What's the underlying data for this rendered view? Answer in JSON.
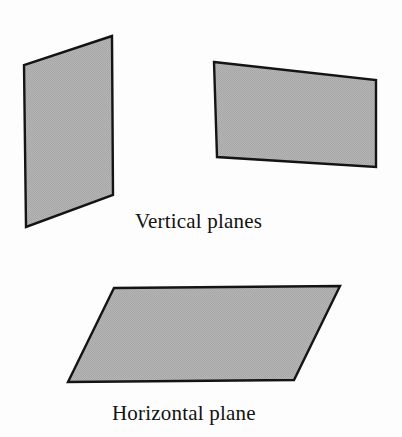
{
  "figure": {
    "width": 402,
    "height": 437,
    "background_color": "#fdfdfd"
  },
  "style": {
    "fill_color": "#b0b0b0",
    "fill_pattern": "dithered-gray-halftone",
    "stroke_color": "#141414",
    "stroke_width": 2.4,
    "text_color": "#121212",
    "caption_font_size": 21
  },
  "shapes": [
    {
      "name": "left-vertical-plane",
      "kind": "quadrilateral",
      "orientation": "vertical",
      "points": "112,36 24,65 26,227 113,195",
      "fill": "#b0b0b0",
      "stroke": "#141414"
    },
    {
      "name": "right-vertical-plane",
      "kind": "quadrilateral",
      "orientation": "vertical",
      "points": "214,62 376,80 376,167 217,157",
      "fill": "#b0b0b0",
      "stroke": "#141414"
    },
    {
      "name": "horizontal-plane",
      "kind": "parallelogram",
      "orientation": "horizontal",
      "points": "114,288 340,286 294,380 68,382",
      "fill": "#b0b0b0",
      "stroke": "#141414"
    }
  ],
  "captions": {
    "vertical": "Vertical planes",
    "horizontal": "Horizontal plane"
  }
}
